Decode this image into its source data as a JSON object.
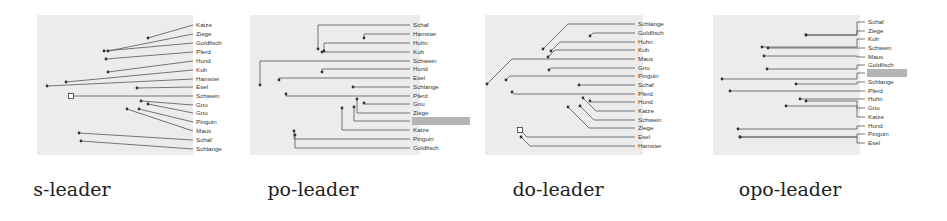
{
  "figure": {
    "background": "#ffffff",
    "panel_background": "#ececec",
    "line_color": "#555555",
    "highlight_color": "#b4b4b4"
  },
  "panels": [
    {
      "id": "s-leader",
      "caption": "s-leader",
      "caption_x": 70,
      "bg": {
        "x": 37,
        "y": 15,
        "w": 156,
        "h": 140
      },
      "label_x": 196,
      "style": "straight",
      "labels": [
        {
          "text": "Katze",
          "y": 25,
          "px": 148,
          "py": 38
        },
        {
          "text": "Ziege",
          "y": 34,
          "px": 108,
          "py": 51
        },
        {
          "text": "Goldfisch",
          "y": 43,
          "px": 104,
          "py": 51
        },
        {
          "text": "Pferd",
          "y": 52,
          "px": 106,
          "py": 59
        },
        {
          "text": "Hund",
          "y": 61,
          "px": 108,
          "py": 72
        },
        {
          "text": "Kuh",
          "y": 70,
          "px": 66,
          "py": 82
        },
        {
          "text": "Hamster",
          "y": 79,
          "px": 47,
          "py": 86
        },
        {
          "text": "Esel",
          "y": 87,
          "px": 137,
          "py": 88
        },
        {
          "text": "Schwein",
          "y": 96,
          "px": 71,
          "py": 96,
          "marker": "square"
        },
        {
          "text": "Gnu",
          "y": 105,
          "px": 141,
          "py": 101
        },
        {
          "text": "Gnu",
          "y": 113,
          "px": 148,
          "py": 104
        },
        {
          "text": "Pinguin",
          "y": 122,
          "px": 139,
          "py": 109
        },
        {
          "text": "Maus",
          "y": 131,
          "px": 127,
          "py": 109
        },
        {
          "text": "Schaf",
          "y": 140,
          "px": 79,
          "py": 133
        },
        {
          "text": "Schlange",
          "y": 149,
          "px": 81,
          "py": 141
        }
      ]
    },
    {
      "id": "po-leader",
      "caption": "po-leader",
      "caption_x": 313,
      "bg": {
        "x": 250,
        "y": 15,
        "w": 170,
        "h": 140
      },
      "label_x": 413,
      "style": "po",
      "labels": [
        {
          "text": "Schaf",
          "y": 25,
          "px": 318,
          "py": 49
        },
        {
          "text": "Hamster",
          "y": 34,
          "px": 364,
          "py": 38
        },
        {
          "text": "Huhn",
          "y": 43,
          "px": 324,
          "py": 51
        },
        {
          "text": "Kuh",
          "y": 52,
          "px": 322,
          "py": 52
        },
        {
          "text": "Schwein",
          "y": 61,
          "px": 260,
          "py": 85
        },
        {
          "text": "Hund",
          "y": 69,
          "px": 322,
          "py": 72
        },
        {
          "text": "Esel",
          "y": 78,
          "px": 279,
          "py": 80
        },
        {
          "text": "Schlange",
          "y": 87,
          "px": 353,
          "py": 87
        },
        {
          "text": "Pferd",
          "y": 96,
          "px": 286,
          "py": 94
        },
        {
          "text": "Gnu",
          "y": 104,
          "px": 364,
          "py": 103
        },
        {
          "text": "Ziege",
          "y": 113,
          "px": 357,
          "py": 99
        },
        {
          "text": "",
          "y": 121,
          "px": 354,
          "py": 107,
          "highlight": true,
          "hw": 58
        },
        {
          "text": "Katze",
          "y": 130,
          "px": 342,
          "py": 108
        },
        {
          "text": "Pinguin",
          "y": 139,
          "px": 294,
          "py": 131
        },
        {
          "text": "Goldfisch",
          "y": 148,
          "px": 295,
          "py": 135
        }
      ]
    },
    {
      "id": "do-leader",
      "caption": "do-leader",
      "caption_x": 560,
      "bg": {
        "x": 485,
        "y": 15,
        "w": 158,
        "h": 140
      },
      "label_x": 638,
      "style": "do",
      "labels": [
        {
          "text": "Schlange",
          "y": 24,
          "px": 543,
          "py": 49
        },
        {
          "text": "Goldfisch",
          "y": 33,
          "px": 590,
          "py": 36
        },
        {
          "text": "Huhn",
          "y": 42,
          "px": 551,
          "py": 51
        },
        {
          "text": "Kuh",
          "y": 50,
          "px": 548,
          "py": 57
        },
        {
          "text": "Maus",
          "y": 59,
          "px": 487,
          "py": 84
        },
        {
          "text": "Gnu",
          "y": 68,
          "px": 549,
          "py": 70
        },
        {
          "text": "Pinguin",
          "y": 76,
          "px": 506,
          "py": 80
        },
        {
          "text": "Schaf",
          "y": 85,
          "px": 579,
          "py": 85
        },
        {
          "text": "Pferd",
          "y": 94,
          "px": 512,
          "py": 92
        },
        {
          "text": "Hund",
          "y": 102,
          "px": 590,
          "py": 101
        },
        {
          "text": "Katze",
          "y": 111,
          "px": 583,
          "py": 98
        },
        {
          "text": "Schwein",
          "y": 120,
          "px": 580,
          "py": 106
        },
        {
          "text": "Ziege",
          "y": 128,
          "px": 568,
          "py": 107
        },
        {
          "text": "Esel",
          "y": 137,
          "px": 520,
          "py": 130,
          "marker": "square"
        },
        {
          "text": "Hamster",
          "y": 146,
          "px": 521,
          "py": 137
        }
      ]
    },
    {
      "id": "opo-leader",
      "caption": "opo-leader",
      "caption_x": 790,
      "bg": {
        "x": 713,
        "y": 15,
        "w": 147,
        "h": 140
      },
      "label_x": 868,
      "style": "opo",
      "labels": [
        {
          "text": "Schaf",
          "y": 22,
          "px": 806,
          "py": 35
        },
        {
          "text": "Ziege",
          "y": 31,
          "px": 806,
          "py": 35
        },
        {
          "text": "Kuh",
          "y": 39,
          "px": 762,
          "py": 47
        },
        {
          "text": "Schwein",
          "y": 48,
          "px": 768,
          "py": 48
        },
        {
          "text": "Maus",
          "y": 57,
          "px": 764,
          "py": 56
        },
        {
          "text": "Goldfisch",
          "y": 65,
          "px": 767,
          "py": 69
        },
        {
          "text": "",
          "y": 73,
          "px": 722,
          "py": 79,
          "highlight": true,
          "hw": 40
        },
        {
          "text": "Schlange",
          "y": 82,
          "px": 796,
          "py": 84
        },
        {
          "text": "Pferd",
          "y": 91,
          "px": 730,
          "py": 91
        },
        {
          "text": "Huhn",
          "y": 99,
          "px": 800,
          "py": 99
        },
        {
          "text": "Gnu",
          "y": 108,
          "px": 806,
          "py": 101
        },
        {
          "text": "Katze",
          "y": 117,
          "px": 786,
          "py": 106
        },
        {
          "text": "Hund",
          "y": 126,
          "px": 738,
          "py": 129
        },
        {
          "text": "Pinguin",
          "y": 134,
          "px": 740,
          "py": 137
        },
        {
          "text": "Esel",
          "y": 143,
          "px": 740,
          "py": 137
        }
      ]
    }
  ]
}
